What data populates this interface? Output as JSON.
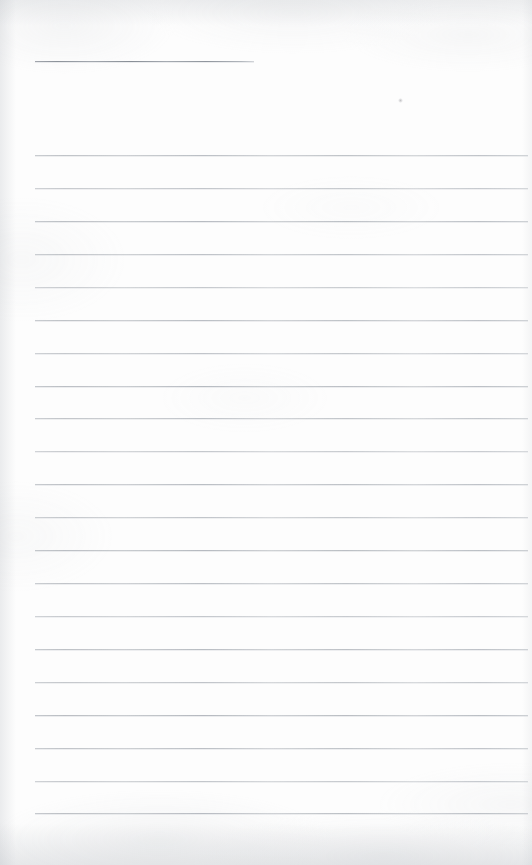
{
  "document": {
    "type": "scanned-lined-page",
    "title": "",
    "page_text": "",
    "note": "",
    "width": 532,
    "height": 865,
    "paper_color": "#fdfdfd",
    "rule_color": "#b6babf",
    "header_rule_color": "#8e949c",
    "is_blank": true
  },
  "header_rule": {
    "name": "header-rule",
    "x": 35,
    "y": 61,
    "width": 219,
    "label": ""
  },
  "ruling": {
    "left": 35,
    "right": 528,
    "first_line_y": 155,
    "spacing": 32.95,
    "count": 21,
    "lines": [
      {
        "index": 1,
        "y": 155,
        "text": ""
      },
      {
        "index": 2,
        "y": 188,
        "text": ""
      },
      {
        "index": 3,
        "y": 221,
        "text": ""
      },
      {
        "index": 4,
        "y": 254,
        "text": ""
      },
      {
        "index": 5,
        "y": 287,
        "text": ""
      },
      {
        "index": 6,
        "y": 320,
        "text": ""
      },
      {
        "index": 7,
        "y": 353,
        "text": ""
      },
      {
        "index": 8,
        "y": 386,
        "text": ""
      },
      {
        "index": 9,
        "y": 418,
        "text": ""
      },
      {
        "index": 10,
        "y": 451,
        "text": ""
      },
      {
        "index": 11,
        "y": 484,
        "text": ""
      },
      {
        "index": 12,
        "y": 517,
        "text": ""
      },
      {
        "index": 13,
        "y": 550,
        "text": ""
      },
      {
        "index": 14,
        "y": 583,
        "text": ""
      },
      {
        "index": 15,
        "y": 616,
        "text": ""
      },
      {
        "index": 16,
        "y": 649,
        "text": ""
      },
      {
        "index": 17,
        "y": 682,
        "text": ""
      },
      {
        "index": 18,
        "y": 715,
        "text": ""
      },
      {
        "index": 19,
        "y": 748,
        "text": ""
      },
      {
        "index": 20,
        "y": 781,
        "text": ""
      },
      {
        "index": 21,
        "y": 813,
        "text": ""
      }
    ]
  },
  "artifacts": [
    {
      "name": "scan-speck",
      "x": 400,
      "y": 100,
      "size": 5
    }
  ]
}
